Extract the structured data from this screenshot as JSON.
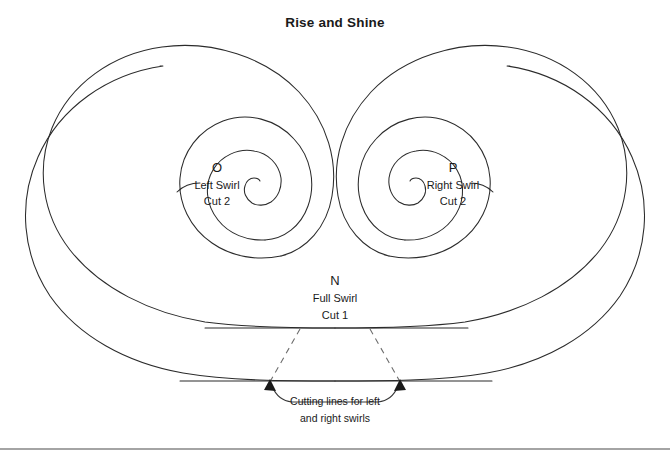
{
  "page": {
    "title": "Rise and Shine",
    "background_color": "#ffffff",
    "line_color": "#2b2b2b",
    "dashed_line_color": "#6d6d6d",
    "text_color": "#1a1a1a"
  },
  "labels": {
    "left_swirl": {
      "letter": "O",
      "name": "Left Swirl",
      "cut": "Cut 2"
    },
    "right_swirl": {
      "letter": "P",
      "name": "Right Swirl",
      "cut": "Cut 2"
    },
    "full_swirl": {
      "letter": "N",
      "name": "Full Swirl",
      "cut": "Cut 1"
    }
  },
  "annotation": {
    "line1": "Cutting lines for left",
    "line2": "and right swirls"
  }
}
